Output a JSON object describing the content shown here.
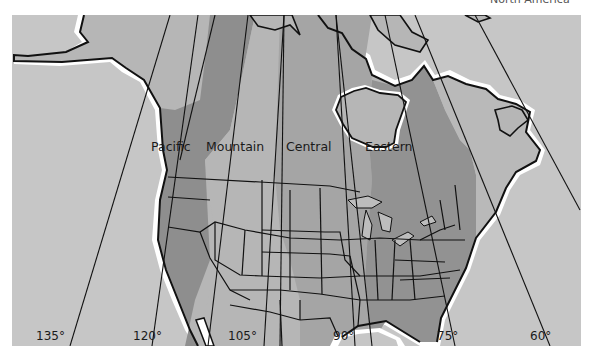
{
  "caption": "North America",
  "colors": {
    "ocean": "#c6c6c6",
    "pacific_zone": "#8e8e8e",
    "mountain_zone": "#b6b6b6",
    "central_zone": "#a5a5a5",
    "eastern_zone": "#929292",
    "atlantic_zone": "#b9b9b9",
    "coast_halo": "#ffffff",
    "border": "#111111"
  },
  "time_zones": [
    {
      "id": "pacific",
      "label": "Pacific"
    },
    {
      "id": "mountain",
      "label": "Mountain"
    },
    {
      "id": "central",
      "label": "Central"
    },
    {
      "id": "eastern",
      "label": "Eastern"
    }
  ],
  "meridians": [
    {
      "label": "135°"
    },
    {
      "label": "120°"
    },
    {
      "label": "105°"
    },
    {
      "label": "90°"
    },
    {
      "label": "75°"
    },
    {
      "label": "60°"
    }
  ]
}
